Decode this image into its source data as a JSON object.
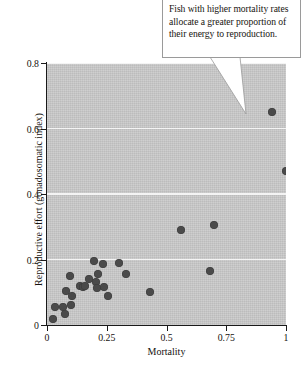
{
  "annotation": {
    "text": "Fish with higher mortality rates allocate a greater proportion of their energy to reproduction.",
    "pointer_target_x": 0.83,
    "pointer_target_y": 0.67
  },
  "colors": {
    "plot_background": "#c9c9c9",
    "gridline": "#f4f4f4",
    "point": "#4a4a4a",
    "axis": "#1a1a1a",
    "text": "#15120e",
    "callout_background": "#ffffff",
    "callout_border": "#9a9a9a"
  },
  "chart_data": {
    "type": "scatter",
    "title": "",
    "xlabel": "Mortality",
    "ylabel": "Reproductive effort (gonadosomatic index)",
    "xlim": [
      0,
      1
    ],
    "ylim": [
      0,
      0.8
    ],
    "xticks": [
      "0",
      "0.25",
      "0.5",
      "0.75",
      "1"
    ],
    "xtick_values": [
      0,
      0.25,
      0.5,
      0.75,
      1
    ],
    "yticks": [
      "0",
      "0.2",
      "0.4",
      "0.6",
      "0.8"
    ],
    "ytick_values": [
      0,
      0.2,
      0.4,
      0.6,
      0.8
    ],
    "grid": "horizontal",
    "legend": "none",
    "points": [
      {
        "x": 0.025,
        "y": 0.018
      },
      {
        "x": 0.035,
        "y": 0.055
      },
      {
        "x": 0.065,
        "y": 0.055
      },
      {
        "x": 0.075,
        "y": 0.035
      },
      {
        "x": 0.1,
        "y": 0.06
      },
      {
        "x": 0.08,
        "y": 0.105
      },
      {
        "x": 0.095,
        "y": 0.15
      },
      {
        "x": 0.105,
        "y": 0.09
      },
      {
        "x": 0.14,
        "y": 0.12
      },
      {
        "x": 0.15,
        "y": 0.115
      },
      {
        "x": 0.16,
        "y": 0.118
      },
      {
        "x": 0.175,
        "y": 0.14
      },
      {
        "x": 0.195,
        "y": 0.195
      },
      {
        "x": 0.205,
        "y": 0.13
      },
      {
        "x": 0.21,
        "y": 0.112
      },
      {
        "x": 0.215,
        "y": 0.155
      },
      {
        "x": 0.235,
        "y": 0.185
      },
      {
        "x": 0.24,
        "y": 0.115
      },
      {
        "x": 0.255,
        "y": 0.09
      },
      {
        "x": 0.3,
        "y": 0.19
      },
      {
        "x": 0.33,
        "y": 0.155
      },
      {
        "x": 0.43,
        "y": 0.1
      },
      {
        "x": 0.56,
        "y": 0.29
      },
      {
        "x": 0.68,
        "y": 0.165
      },
      {
        "x": 0.7,
        "y": 0.305
      },
      {
        "x": 0.94,
        "y": 0.65
      },
      {
        "x": 1.0,
        "y": 0.47
      }
    ]
  }
}
